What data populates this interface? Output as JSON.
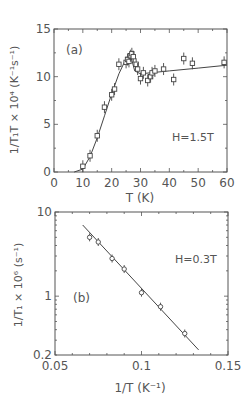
{
  "chart_data": [
    {
      "panel": "(a)",
      "type": "scatter",
      "title": "",
      "xlabel": "T (K)",
      "ylabel": "1/T₁T × 10⁴ (K⁻¹s⁻¹)",
      "xlim": [
        0,
        60
      ],
      "ylim": [
        0,
        15
      ],
      "xticks": [
        "0",
        "10",
        "20",
        "30",
        "40",
        "50",
        "60"
      ],
      "yticks": [
        "0",
        "5",
        "10",
        "15"
      ],
      "annotation": "H=1.5T",
      "grid": false,
      "legend": null,
      "series": [
        {
          "name": "data",
          "x": [
            10,
            12.5,
            15,
            17.5,
            20,
            21,
            22.5,
            25,
            25.5,
            26,
            26.5,
            27,
            27.5,
            28.5,
            29,
            30,
            31,
            32.5,
            33.5,
            34,
            35,
            38,
            41.5,
            45,
            48,
            59
          ],
          "y": [
            0.6,
            1.7,
            3.8,
            6.8,
            8.1,
            8.7,
            11.3,
            11.5,
            11.8,
            11.6,
            12.2,
            12.4,
            12.1,
            11.3,
            10.8,
            9.8,
            10.4,
            9.6,
            10.0,
            10.4,
            10.6,
            10.8,
            9.7,
            11.9,
            11.4,
            11.5
          ]
        },
        {
          "name": "fit",
          "x": [
            7,
            10,
            12.5,
            15,
            17.5,
            20,
            22.5,
            25,
            26.5,
            28,
            30,
            40,
            50,
            60
          ],
          "y": [
            0,
            0.3,
            1.6,
            3.6,
            5.9,
            8.2,
            10.3,
            11.9,
            12.3,
            10.6,
            10.3,
            10.6,
            10.9,
            11.2
          ]
        }
      ]
    },
    {
      "panel": "(b)",
      "type": "scatter",
      "title": "",
      "xlabel": "1/T (K⁻¹)",
      "ylabel": "1/T₁ × 10⁶ (s⁻¹)",
      "xlim": [
        0.05,
        0.15
      ],
      "ylim": [
        0.2,
        10
      ],
      "yscale": "log",
      "xticks": [
        "0.05",
        "0.1",
        "0.15"
      ],
      "yticks": [
        "0.2",
        "1",
        "10"
      ],
      "annotation": "H=0.3T",
      "grid": false,
      "legend": null,
      "series": [
        {
          "name": "data",
          "x": [
            0.07,
            0.075,
            0.083,
            0.09,
            0.1,
            0.111,
            0.125
          ],
          "y": [
            5.0,
            4.4,
            2.8,
            2.1,
            1.1,
            0.75,
            0.36
          ]
        },
        {
          "name": "fit",
          "x": [
            0.066,
            0.133
          ],
          "y": [
            7.0,
            0.23
          ]
        }
      ]
    }
  ],
  "labels": {
    "a": {
      "panel": "(a)",
      "annotation": "H=1.5T",
      "xlabel": "T (K)",
      "ylabel": "1/T₁T × 10⁴ (K⁻¹s⁻¹)",
      "xticks": [
        "0",
        "10",
        "20",
        "30",
        "40",
        "50",
        "60"
      ],
      "yticks": [
        "0",
        "5",
        "10",
        "15"
      ]
    },
    "b": {
      "panel": "(b)",
      "annotation": "H=0.3T",
      "xlabel": "1/T (K⁻¹)",
      "ylabel": "1/T₁ × 10⁶ (s⁻¹)",
      "xticks": [
        "0.05",
        "0.1",
        "0.15"
      ],
      "yticks": [
        "0.2",
        "1",
        "10"
      ]
    }
  }
}
